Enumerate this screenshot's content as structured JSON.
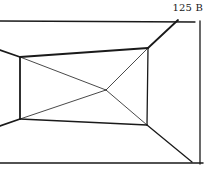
{
  "figure": {
    "label": "125 B",
    "stroke_color": "#1a1a1a"
  }
}
